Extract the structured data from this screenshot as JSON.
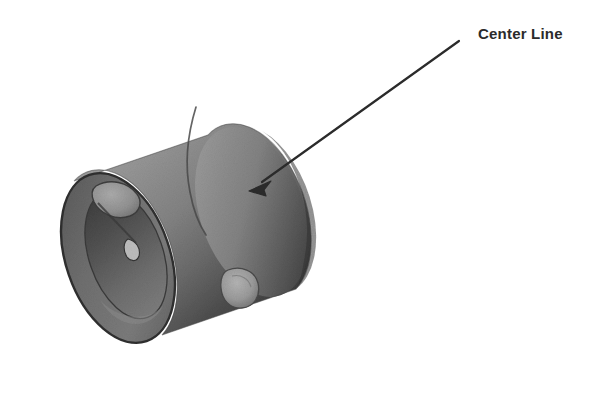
{
  "figure": {
    "kind": "3d-cad-render",
    "background_color": "#ffffff"
  },
  "annotations": [
    {
      "id": "center-line",
      "label": "Center Line",
      "label_x": 478,
      "label_y": 26,
      "color": "#2b2b2b",
      "leader": {
        "tail_x": 459,
        "tail_y": 41,
        "tip_x": 251,
        "tip_y": 190,
        "stroke_width": 2.2,
        "head_length": 17,
        "head_width": 11
      }
    }
  ],
  "colors": {
    "body_light": "#9a9a9a",
    "body_mid": "#7e7e7e",
    "body_dark": "#434343",
    "body_darkest": "#333333",
    "end_face": "#6d6d6d",
    "bore_interior": "#585858",
    "rim_edge": "#2f2f2f",
    "seam_line": "#4a4a4a",
    "highlight_patch": "#a8a8a8",
    "outline": "#3c3c3c",
    "label_text": "#2b2b2b",
    "background": "#ffffff"
  },
  "geometry": {
    "cylinder": {
      "axis_start_x": 118,
      "axis_start_y": 258,
      "axis_end_x": 252,
      "axis_end_y": 212,
      "near_end_center_x": 118,
      "near_end_center_y": 258,
      "far_end_center_x": 252,
      "far_end_center_y": 212,
      "outer_radius_x": 52,
      "outer_radius_y": 88,
      "inner_radius_x": 38,
      "inner_radius_y": 66,
      "tilt_degrees": -19,
      "bounds": {
        "left": 35,
        "top": 103,
        "right": 324,
        "bottom": 369
      }
    },
    "features": [
      {
        "name": "rim-notch-cutout",
        "x": 118,
        "y": 213,
        "rx": 23,
        "ry": 15,
        "tone": "#9e9e9e"
      },
      {
        "name": "bore-highlight",
        "x": 133,
        "y": 250,
        "rx": 9,
        "ry": 11,
        "tone": "#b2b2b2"
      },
      {
        "name": "side-wall-hole",
        "x": 241,
        "y": 287,
        "rx": 16,
        "ry": 19,
        "tone": "#9d9d9d"
      },
      {
        "name": "body-seam-line",
        "x": 196,
        "y": 110,
        "rx": 0,
        "ry": 0,
        "tone": "#4a4a4a"
      }
    ]
  }
}
